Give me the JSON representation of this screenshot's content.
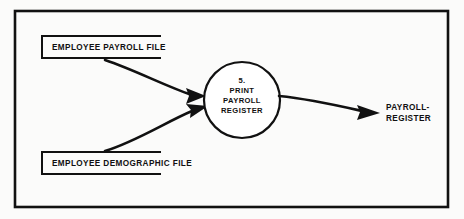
{
  "diagram": {
    "kind": "data-flow-diagram",
    "colors": {
      "ink": "#111111",
      "background": "#fbfbfa",
      "border": "#111111"
    },
    "frame": {
      "name": "diagram-border",
      "x": 14,
      "y": 10,
      "width": 434,
      "height": 197
    },
    "data_stores": [
      {
        "id": "employee-payroll-file",
        "label": "EMPLOYEE PAYROLL FILE",
        "shape": "open-ended-rectangle",
        "x": 42,
        "y": 36,
        "width": 120,
        "height": 22
      },
      {
        "id": "employee-demographic-file",
        "label": "EMPLOYEE DEMOGRAPHIC FILE",
        "shape": "open-ended-rectangle",
        "x": 42,
        "y": 152,
        "width": 120,
        "height": 22
      }
    ],
    "process": {
      "id": "print-payroll-register",
      "number": "5.",
      "lines": [
        "5.",
        "PRINT",
        "PAYROLL",
        "REGISTER"
      ],
      "shape": "circle",
      "cx": 242,
      "cy": 100,
      "r": 38
    },
    "flows": [
      {
        "id": "flow-payroll-file-to-process",
        "from": "employee-payroll-file",
        "to": "print-payroll-register",
        "label": "",
        "style": "curved-arrow"
      },
      {
        "id": "flow-demographic-file-to-process",
        "from": "employee-demographic-file",
        "to": "print-payroll-register",
        "label": "",
        "style": "curved-arrow"
      },
      {
        "id": "flow-process-to-payroll-register",
        "from": "print-payroll-register",
        "to": "payroll-register-output",
        "label": "PAYROLL-REGISTER",
        "style": "straight-arrow"
      }
    ],
    "outputs": [
      {
        "id": "payroll-register-output",
        "lines": [
          "PAYROLL-",
          "REGISTER"
        ],
        "x": 385,
        "y": 97
      }
    ]
  }
}
